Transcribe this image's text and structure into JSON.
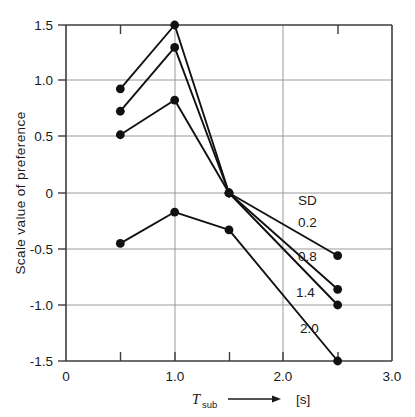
{
  "chart_data": {
    "type": "line",
    "title": "",
    "xlabel": "T_sub  [s]",
    "ylabel": "Scale value of preference",
    "xlim": [
      0,
      3.0
    ],
    "ylim": [
      -1.5,
      1.5
    ],
    "grid": true,
    "legend_position": "inline-right",
    "legend_heading": "SD",
    "x_tick_labels": [
      "0",
      "1.0",
      "2.0",
      "3.0"
    ],
    "x_tick_values": [
      0,
      1.0,
      2.0,
      3.0
    ],
    "x_minor_tick_values": [
      0.5,
      1.5,
      2.5
    ],
    "y_tick_labels": [
      "1.5",
      "1.0",
      "0.5",
      "0",
      "-0.5",
      "-1.0",
      "-1.5"
    ],
    "y_tick_values": [
      1.5,
      1.0,
      0.5,
      0,
      -0.5,
      -1.0,
      -1.5
    ],
    "x": [
      0.5,
      1.0,
      1.5,
      2.5
    ],
    "series": [
      {
        "name": "0.2",
        "values": [
          0.93,
          1.5,
          0.0,
          -0.56
        ]
      },
      {
        "name": "0.8",
        "values": [
          0.73,
          1.3,
          0.0,
          -0.86
        ]
      },
      {
        "name": "1.4",
        "values": [
          0.52,
          0.83,
          0.0,
          -1.0
        ]
      },
      {
        "name": "2.0",
        "values": [
          -0.45,
          -0.17,
          -0.33,
          -1.5
        ]
      }
    ],
    "series_label_positions": [
      {
        "name": "0.2",
        "x": 2.0,
        "y": 0.34
      },
      {
        "name": "0.8",
        "x": 2.0,
        "y": -0.03
      },
      {
        "name": "1.4",
        "x": 1.97,
        "y": -0.38
      },
      {
        "name": "2.0",
        "x": 2.0,
        "y": -0.72
      }
    ],
    "marker": "filled-circle",
    "line_color": "#111111",
    "grid_color": "#9a9a9a",
    "axis_color": "#3c3c3c"
  },
  "axes": {
    "x_axis_symbol": "T",
    "x_axis_subscript": "sub",
    "x_axis_unit": "[s]"
  }
}
